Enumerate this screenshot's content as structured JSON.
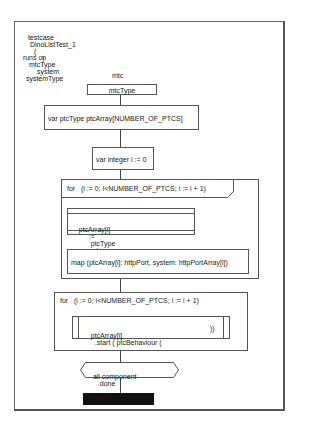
{
  "header": {
    "testcase_keyword": "testcase",
    "testcase_name": "DinoListTest_1",
    "params_open": "(",
    "params_close": ")",
    "runs_on_keyword": "runs on",
    "runs_on_type": "mtcType",
    "system_keyword": "system",
    "system_type": "systemType"
  },
  "instance": {
    "name": "mtc",
    "type": "mtcType"
  },
  "statements": {
    "var_array": "var ptcType ptcArray[NUMBER_OF_PTCS]",
    "var_int": "var integer i := 0",
    "for_loop_1": {
      "header": "for   (i := 0; i<NUMBER_OF_PTCS; i := i + 1)",
      "create": {
        "target": "ptcArray[i]",
        "assign": ":=",
        "type": "ptcType",
        "op": ".create"
      },
      "map": "map (ptcArray[i]: httpPort, system: httpPortArray[i])"
    },
    "for_loop_2": {
      "header": "for   (i := 0; i<NUMBER_OF_PTCS; i := i + 1)",
      "start": {
        "target": "ptcArray[i]",
        "op": ".start ( ptcBehaviour (",
        "close": "))"
      }
    },
    "done": {
      "subject": "all component",
      "op": ".done"
    }
  },
  "colors": {
    "stroke": "#555555",
    "terminator": "#111111",
    "background": "#ffffff"
  }
}
